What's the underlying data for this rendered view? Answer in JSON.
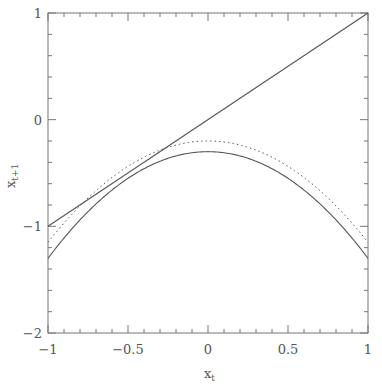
{
  "chart_data": {
    "type": "line",
    "title": "",
    "xlabel": "x",
    "xlabel_sub": "t",
    "ylabel": "x",
    "ylabel_sub": "t+1",
    "xlim": [
      -1,
      1
    ],
    "ylim": [
      -2,
      1
    ],
    "grid": false,
    "legend": null,
    "x_ticks_major": [
      -1,
      -0.5,
      0,
      0.5,
      1
    ],
    "x_tick_labels": [
      "−1",
      "−0.5",
      "0",
      "0.5",
      "1"
    ],
    "x_minor_step": 0.1,
    "y_ticks_major": [
      1,
      0,
      -1,
      -2
    ],
    "y_tick_labels": [
      "1",
      "0",
      "−1",
      "−2"
    ],
    "y_minor_step": 0.2,
    "series": [
      {
        "name": "identity",
        "style": "solid",
        "formula": "x_{t+1} = x_t",
        "x": [
          -1,
          1
        ],
        "y": [
          -1,
          1
        ]
      },
      {
        "name": "map-solid",
        "style": "solid",
        "formula": "x_{t+1} ≈ -0.3 - x_t^2",
        "a": -0.3,
        "b": -1.0,
        "x": [
          -1,
          -0.75,
          -0.5,
          -0.25,
          0,
          0.25,
          0.5,
          0.75,
          1
        ],
        "y": [
          -1.3,
          -0.86,
          -0.55,
          -0.36,
          -0.3,
          -0.36,
          -0.55,
          -0.86,
          -1.3
        ]
      },
      {
        "name": "map-dotted",
        "style": "dotted",
        "formula": "x_{t+1} ≈ -0.2 - 0.95 x_t^2",
        "a": -0.2,
        "b": -0.95,
        "x": [
          -1,
          -0.75,
          -0.5,
          -0.25,
          0,
          0.25,
          0.5,
          0.75,
          1
        ],
        "y": [
          -1.15,
          -0.73,
          -0.44,
          -0.26,
          -0.2,
          -0.26,
          -0.44,
          -0.73,
          -1.15
        ]
      }
    ]
  },
  "colors": {
    "line": "#555555",
    "axis": "#777777",
    "text": "#555555"
  }
}
